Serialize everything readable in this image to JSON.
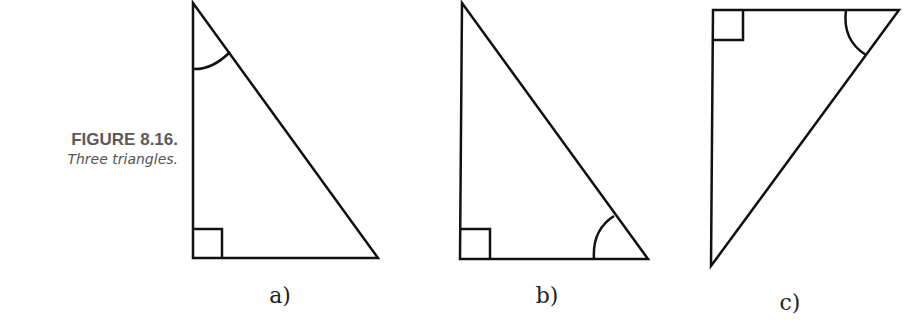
{
  "caption": {
    "figure_number": "FIGURE 8.16.",
    "description": "Three triangles."
  },
  "triangles": [
    {
      "label": "a)",
      "marked_angle": "top",
      "right_angle": "bottom-left"
    },
    {
      "label": "b)",
      "marked_angle": "bottom-right",
      "right_angle": "bottom-left"
    },
    {
      "label": "c)",
      "marked_angle": "top-right",
      "right_angle": "top-left"
    }
  ],
  "colors": {
    "stroke": "#111111",
    "caption_title": "#5a5a5a",
    "caption_text": "#555555"
  }
}
